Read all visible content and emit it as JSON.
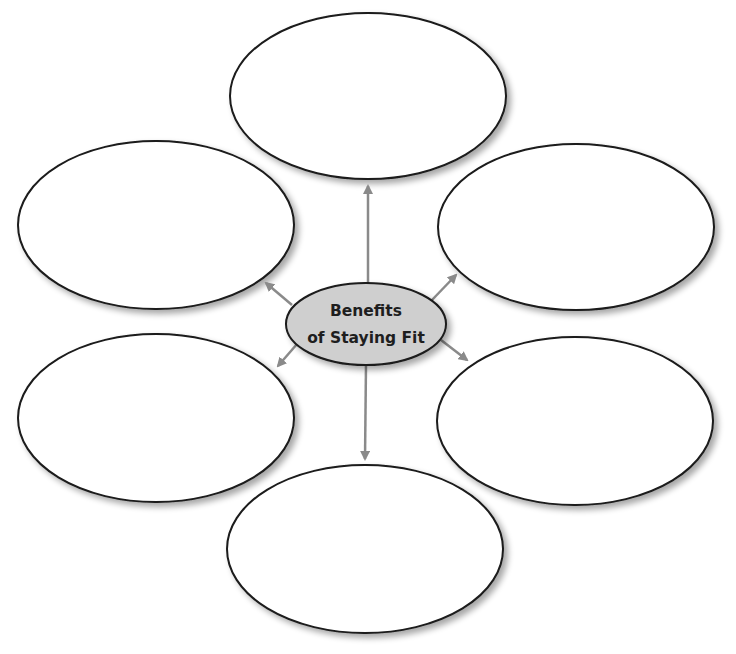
{
  "diagram": {
    "type": "concept-web",
    "center": {
      "line1": "Benefits",
      "line2": "of Staying Fit",
      "fill": "#cfcfcf"
    },
    "bubbles": [
      {
        "position": "top",
        "text": ""
      },
      {
        "position": "upper-left",
        "text": ""
      },
      {
        "position": "upper-right",
        "text": ""
      },
      {
        "position": "lower-left",
        "text": ""
      },
      {
        "position": "lower-right",
        "text": ""
      },
      {
        "position": "bottom",
        "text": ""
      }
    ],
    "colors": {
      "outline": "#1a1a1a",
      "arrow": "#8a8a8a",
      "bubble_fill": "#ffffff"
    }
  }
}
